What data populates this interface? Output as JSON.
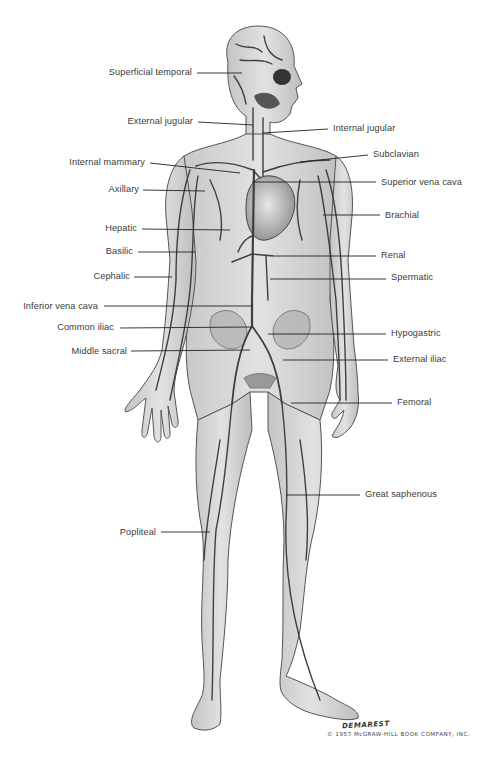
{
  "diagram": {
    "type": "anatomical-illustration",
    "colors": {
      "background": "#ffffff",
      "skin": "#d9d9d9",
      "skin_shadow": "#b8b8b8",
      "vein": "#4a4a4a",
      "label_text": "#3a3a3a",
      "leader_line": "#222222"
    },
    "labels_left": [
      {
        "id": "superficial-temporal",
        "text": "Superficial temporal",
        "x_text_right": 192,
        "y": 73,
        "line": [
          197,
          73,
          242,
          73
        ]
      },
      {
        "id": "external-jugular",
        "text": "External jugular",
        "x_text_right": 193,
        "y": 122,
        "line": [
          198,
          122,
          253,
          125
        ]
      },
      {
        "id": "internal-mammary",
        "text": "Internal mammary",
        "x_text_right": 145,
        "y": 163,
        "line": [
          150,
          163,
          240,
          173
        ]
      },
      {
        "id": "axillary",
        "text": "Axillary",
        "x_text_right": 139,
        "y": 190,
        "line": [
          143,
          190,
          205,
          191
        ]
      },
      {
        "id": "hepatic",
        "text": "Hepatic",
        "x_text_right": 137,
        "y": 229,
        "line": [
          142,
          229,
          230,
          230
        ]
      },
      {
        "id": "basilic",
        "text": "Basilic",
        "x_text_right": 133,
        "y": 252,
        "line": [
          138,
          252,
          195,
          252
        ]
      },
      {
        "id": "cephalic",
        "text": "Cephalic",
        "x_text_right": 136,
        "y": 277,
        "line": [
          134,
          277,
          172,
          277
        ]
      },
      {
        "id": "inferior-vena-cava",
        "text": "Inferior vena cava",
        "x_text_right": 98,
        "y": 307,
        "line": [
          104,
          306,
          253,
          306
        ]
      },
      {
        "id": "common-iliac",
        "text": "Common iliac",
        "x_text_right": 114,
        "y": 328,
        "line": [
          120,
          328,
          252,
          327
        ]
      },
      {
        "id": "middle-sacral",
        "text": "Middle sacral",
        "x_text_right": 127,
        "y": 352,
        "line": [
          131,
          351,
          250,
          350
        ]
      },
      {
        "id": "popliteal",
        "text": "Popliteal",
        "x_text_right": 156,
        "y": 533,
        "line": [
          161,
          532,
          210,
          532
        ]
      }
    ],
    "labels_right": [
      {
        "id": "internal-jugular",
        "text": "Internal jugular",
        "x_text_left": 333,
        "y": 129,
        "line": [
          263,
          133,
          328,
          129
        ]
      },
      {
        "id": "subclavian",
        "text": "Subclavian",
        "x_text_left": 373,
        "y": 155,
        "line": [
          300,
          162,
          368,
          155
        ]
      },
      {
        "id": "superior-vena-cava",
        "text": "Superior vena cava",
        "x_text_left": 381,
        "y": 182,
        "line": [
          252,
          182,
          376,
          182
        ]
      },
      {
        "id": "brachial",
        "text": "Brachial",
        "x_text_left": 385,
        "y": 215,
        "line": [
          323,
          215,
          380,
          215
        ]
      },
      {
        "id": "renal",
        "text": "Renal",
        "x_text_left": 381,
        "y": 256,
        "line": [
          275,
          256,
          376,
          256
        ]
      },
      {
        "id": "spermatic",
        "text": "Spermatic",
        "x_text_left": 391,
        "y": 278,
        "line": [
          270,
          279,
          386,
          279
        ]
      },
      {
        "id": "hypogastric",
        "text": "Hypogastric",
        "x_text_left": 391,
        "y": 334,
        "line": [
          268,
          334,
          386,
          334
        ]
      },
      {
        "id": "external-iliac",
        "text": "External iliac",
        "x_text_left": 393,
        "y": 360,
        "line": [
          283,
          360,
          388,
          360
        ]
      },
      {
        "id": "femoral",
        "text": "Femoral",
        "x_text_left": 397,
        "y": 403,
        "line": [
          291,
          403,
          392,
          403
        ]
      },
      {
        "id": "great-saphenous",
        "text": "Great saphenous",
        "x_text_left": 365,
        "y": 495,
        "line": [
          286,
          495,
          360,
          495
        ]
      }
    ],
    "signature": "DEMAREST",
    "copyright": "© 1957 McGRAW-HILL BOOK COMPANY, INC."
  }
}
